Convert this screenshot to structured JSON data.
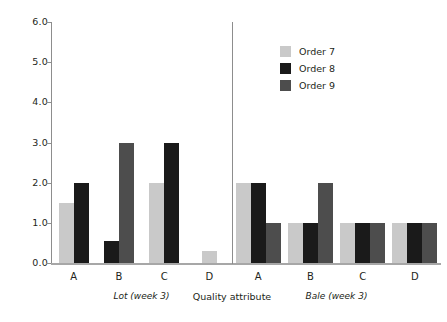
{
  "chart_data": {
    "type": "bar",
    "title": "",
    "xlabel": "Quality attribute",
    "ylabel": "",
    "ylim": [
      0,
      6
    ],
    "ytick_labels": [
      "0.0",
      "1.0",
      "2.0",
      "3.0",
      "4.0",
      "5.0",
      "6.0"
    ],
    "ytick_values": [
      0,
      1,
      2,
      3,
      4,
      5,
      6
    ],
    "grid": false,
    "legend_position": "top-right",
    "legend": [
      "Order 7",
      "Order 8",
      "Order 9"
    ],
    "series_colors": [
      "#c9c9c9",
      "#1a1a1a",
      "#4d4d4d"
    ],
    "panels": [
      {
        "label": "Lot (week 3)",
        "categories": [
          "A",
          "B",
          "C",
          "D"
        ],
        "series": [
          {
            "name": "Order 7",
            "color": "#c9c9c9",
            "values": [
              1.5,
              null,
              2.0,
              0.3
            ]
          },
          {
            "name": "Order 8",
            "color": "#1a1a1a",
            "values": [
              2.0,
              0.55,
              3.0,
              null
            ]
          },
          {
            "name": "Order 9",
            "color": "#4d4d4d",
            "values": [
              null,
              3.0,
              null,
              null
            ]
          }
        ]
      },
      {
        "label": "Bale (week 3)",
        "categories": [
          "A",
          "B",
          "C",
          "D"
        ],
        "series": [
          {
            "name": "Order 7",
            "color": "#c9c9c9",
            "values": [
              2.0,
              1.0,
              1.0,
              1.0
            ]
          },
          {
            "name": "Order 8",
            "color": "#1a1a1a",
            "values": [
              2.0,
              1.0,
              1.0,
              1.0
            ]
          },
          {
            "name": "Order 9",
            "color": "#4d4d4d",
            "values": [
              1.0,
              2.0,
              1.0,
              1.0
            ]
          }
        ]
      }
    ]
  }
}
